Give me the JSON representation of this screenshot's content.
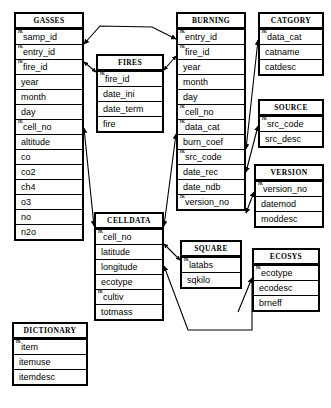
{
  "diagram": {
    "type": "entity-relationship-diagram",
    "background_color": "#ffffff",
    "line_color": "#000000",
    "entities": [
      {
        "id": "gasses",
        "name": "GASSES",
        "x": 14,
        "y": 12,
        "w": 70,
        "attributes": [
          {
            "name": "samp_id",
            "key": "PK"
          },
          {
            "name": "entry_id",
            "key": "FK"
          },
          {
            "name": "fire_id",
            "key": "FK"
          },
          {
            "name": "year",
            "key": ""
          },
          {
            "name": "month",
            "key": ""
          },
          {
            "name": "day",
            "key": ""
          },
          {
            "name": "cell_no",
            "key": "FK"
          },
          {
            "name": "altitude",
            "key": ""
          },
          {
            "name": "co",
            "key": ""
          },
          {
            "name": "co2",
            "key": ""
          },
          {
            "name": "ch4",
            "key": ""
          },
          {
            "name": "o3",
            "key": ""
          },
          {
            "name": "no",
            "key": ""
          },
          {
            "name": "n2o",
            "key": ""
          }
        ]
      },
      {
        "id": "fires",
        "name": "FIRES",
        "x": 96,
        "y": 54,
        "w": 68,
        "attributes": [
          {
            "name": "fire_id",
            "key": "PK"
          },
          {
            "name": "date_ini",
            "key": ""
          },
          {
            "name": "date_term",
            "key": ""
          },
          {
            "name": "fire",
            "key": ""
          }
        ]
      },
      {
        "id": "celldata",
        "name": "CELLDATA",
        "x": 94,
        "y": 212,
        "w": 70,
        "attributes": [
          {
            "name": "cell_no",
            "key": "PK"
          },
          {
            "name": "latitude",
            "key": ""
          },
          {
            "name": "longitude",
            "key": ""
          },
          {
            "name": "ecotype",
            "key": ""
          },
          {
            "name": "cultiv",
            "key": "PK"
          },
          {
            "name": "totmass",
            "key": ""
          }
        ]
      },
      {
        "id": "dictionary",
        "name": "DICTIONARY",
        "x": 12,
        "y": 322,
        "w": 76,
        "attributes": [
          {
            "name": "item",
            "key": "PK"
          },
          {
            "name": "itemuse",
            "key": ""
          },
          {
            "name": "itemdesc",
            "key": ""
          }
        ]
      },
      {
        "id": "burning",
        "name": "BURNING",
        "x": 176,
        "y": 12,
        "w": 70,
        "attributes": [
          {
            "name": "entry_id",
            "key": "PK"
          },
          {
            "name": "fire_id",
            "key": "FK"
          },
          {
            "name": "year",
            "key": ""
          },
          {
            "name": "month",
            "key": ""
          },
          {
            "name": "day",
            "key": ""
          },
          {
            "name": "cell_no",
            "key": "FK"
          },
          {
            "name": "data_cat",
            "key": "FK"
          },
          {
            "name": "burn_coef",
            "key": ""
          },
          {
            "name": "src_code",
            "key": "FK"
          },
          {
            "name": "date_rec",
            "key": ""
          },
          {
            "name": "date_ndb",
            "key": ""
          },
          {
            "name": "version_no",
            "key": "FK"
          }
        ]
      },
      {
        "id": "square",
        "name": "SQUARE",
        "x": 180,
        "y": 240,
        "w": 62,
        "attributes": [
          {
            "name": "latabs",
            "key": "PK"
          },
          {
            "name": "sqkilo",
            "key": ""
          }
        ]
      },
      {
        "id": "catgory",
        "name": "CATGORY",
        "x": 258,
        "y": 12,
        "w": 66,
        "attributes": [
          {
            "name": "data_cat",
            "key": "PK"
          },
          {
            "name": "catname",
            "key": ""
          },
          {
            "name": "catdesc",
            "key": ""
          }
        ]
      },
      {
        "id": "source",
        "name": "SOURCE",
        "x": 258,
        "y": 99,
        "w": 66,
        "attributes": [
          {
            "name": "src_code",
            "key": "PK"
          },
          {
            "name": "src_desc",
            "key": ""
          }
        ]
      },
      {
        "id": "version",
        "name": "VERSION",
        "x": 254,
        "y": 164,
        "w": 70,
        "attributes": [
          {
            "name": "version_no",
            "key": "PK"
          },
          {
            "name": "datemod",
            "key": ""
          },
          {
            "name": "moddesc",
            "key": ""
          }
        ]
      },
      {
        "id": "ecosys",
        "name": "ECOSYS",
        "x": 252,
        "y": 248,
        "w": 68,
        "attributes": [
          {
            "name": "ecotype",
            "key": "PK"
          },
          {
            "name": "ecodesc",
            "key": ""
          },
          {
            "name": "brneff",
            "key": ""
          }
        ]
      }
    ],
    "relationships": [
      {
        "from": "burning",
        "to": "gasses",
        "label": "burning-to-gasses"
      },
      {
        "from": "fires",
        "to": "gasses",
        "label": "fires-to-gasses"
      },
      {
        "from": "fires",
        "to": "burning",
        "label": "fires-to-burning"
      },
      {
        "from": "gasses",
        "to": "celldata",
        "label": "gasses-to-celldata"
      },
      {
        "from": "burning",
        "to": "celldata",
        "label": "burning-to-celldata"
      },
      {
        "from": "burning",
        "to": "catgory",
        "label": "burning-to-catgory"
      },
      {
        "from": "burning",
        "to": "source",
        "label": "burning-to-source"
      },
      {
        "from": "burning",
        "to": "version",
        "label": "burning-to-version"
      },
      {
        "from": "celldata",
        "to": "square",
        "label": "celldata-to-square"
      },
      {
        "from": "celldata",
        "to": "ecosys",
        "label": "celldata-to-ecosys"
      }
    ]
  }
}
